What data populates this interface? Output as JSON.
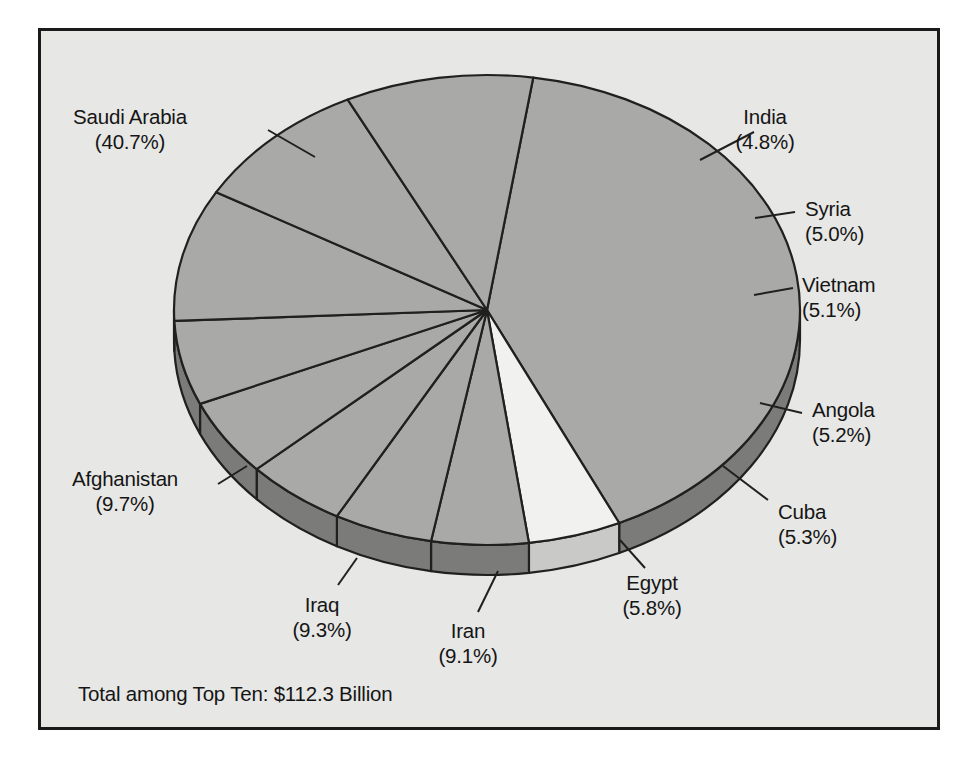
{
  "figure": {
    "background_color": "#ffffff",
    "panel_color": "#e7e7e5",
    "border_color": "#1a1a1a"
  },
  "footer": {
    "total_note": "Total among Top Ten: $112.3 Billion"
  },
  "chart_data": {
    "type": "pie",
    "title": "",
    "subtitle": "",
    "xlabel": "",
    "ylabel": "",
    "legend_position": "none",
    "grid": false,
    "three_d": true,
    "value_unit": "percent",
    "total_label": "Total among Top Ten: $112.3 Billion",
    "total_value": 112.3,
    "total_unit": "Billion USD",
    "categories": [
      "Saudi Arabia",
      "India",
      "Syria",
      "Vietnam",
      "Angola",
      "Cuba",
      "Egypt",
      "Iran",
      "Iraq",
      "Afghanistan"
    ],
    "values": [
      40.7,
      4.8,
      5.0,
      5.1,
      5.2,
      5.3,
      5.8,
      9.1,
      9.3,
      9.7
    ],
    "slice_colors": [
      "#a9a9a7",
      "#f1f1ef",
      "#a9a9a7",
      "#a9a9a7",
      "#a9a9a7",
      "#a9a9a7",
      "#a9a9a7",
      "#a9a9a7",
      "#a9a9a7",
      "#a9a9a7"
    ],
    "side_colors": [
      "#7b7b79",
      "#c9c9c7",
      "#7b7b79",
      "#7b7b79",
      "#7b7b79",
      "#7b7b79",
      "#7b7b79",
      "#7b7b79",
      "#7b7b79",
      "#7b7b79"
    ],
    "outline_color": "#20201f",
    "labels": [
      {
        "name": "Saudi Arabia",
        "percent": "(40.7%)",
        "align": "center",
        "x": 130,
        "y": 104,
        "leader": [
          [
            268,
            130
          ],
          [
            315,
            157
          ]
        ]
      },
      {
        "name": "India",
        "percent": "(4.8%)",
        "align": "center",
        "x": 765,
        "y": 104,
        "leader": [
          [
            754,
            132
          ],
          [
            700,
            160
          ]
        ]
      },
      {
        "name": "Syria",
        "percent": "(5.0%)",
        "align": "left",
        "x": 805,
        "y": 196,
        "leader": [
          [
            795,
            212
          ],
          [
            755,
            218
          ]
        ]
      },
      {
        "name": "Vietnam",
        "percent": "(5.1%)",
        "align": "left",
        "x": 802,
        "y": 272,
        "leader": [
          [
            793,
            288
          ],
          [
            754,
            295
          ]
        ]
      },
      {
        "name": "Angola",
        "percent": "(5.2%)",
        "align": "left",
        "x": 812,
        "y": 397,
        "leader": [
          [
            802,
            413
          ],
          [
            760,
            403
          ]
        ]
      },
      {
        "name": "Cuba",
        "percent": "(5.3%)",
        "align": "left",
        "x": 778,
        "y": 499,
        "leader": [
          [
            768,
            500
          ],
          [
            723,
            466
          ]
        ]
      },
      {
        "name": "Egypt",
        "percent": "(5.8%)",
        "align": "center",
        "x": 652,
        "y": 570,
        "leader": [
          [
            645,
            568
          ],
          [
            620,
            540
          ]
        ]
      },
      {
        "name": "Iran",
        "percent": "(9.1%)",
        "align": "center",
        "x": 468,
        "y": 618,
        "leader": [
          [
            478,
            612
          ],
          [
            498,
            571
          ]
        ]
      },
      {
        "name": "Iraq",
        "percent": "(9.3%)",
        "align": "center",
        "x": 322,
        "y": 592,
        "leader": [
          [
            338,
            585
          ],
          [
            357,
            558
          ]
        ]
      },
      {
        "name": "Afghanistan",
        "percent": "(9.7%)",
        "align": "center",
        "x": 125,
        "y": 466,
        "leader": [
          [
            218,
            484
          ],
          [
            247,
            466
          ]
        ]
      }
    ],
    "geometry": {
      "cx": 487,
      "cy": 310,
      "rx": 313,
      "ry": 235,
      "depth": 30,
      "start_angle_deg": -81.5,
      "direction": "clockwise"
    }
  }
}
